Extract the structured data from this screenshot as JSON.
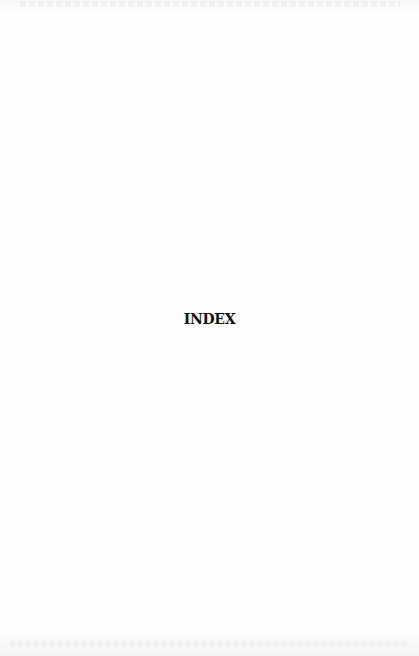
{
  "page": {
    "heading": "INDEX"
  },
  "colors": {
    "paper": "#fdfdfd",
    "ink": "#111111"
  }
}
